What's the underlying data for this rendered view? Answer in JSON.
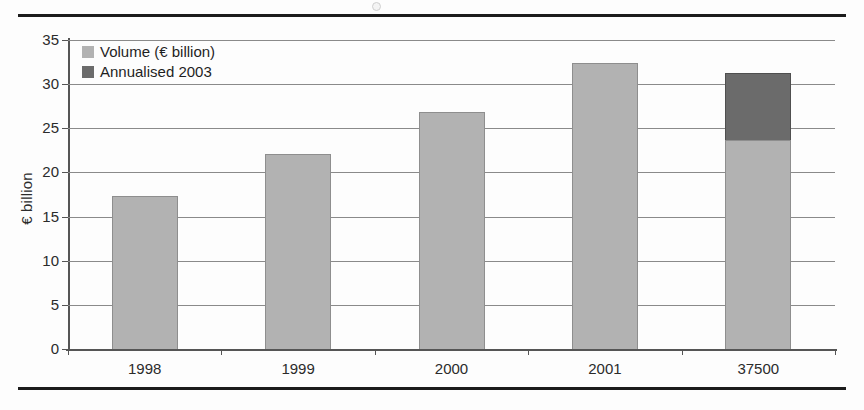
{
  "figure": {
    "background_color": "#fdfdfd",
    "rule_color": "#1c1c1c"
  },
  "legend": {
    "position": "top-left-inside",
    "items": [
      {
        "label": "Volume (€ billion)",
        "color": "#b2b2b2",
        "swatch_name": "legend-swatch-volume"
      },
      {
        "label": "Annualised 2003",
        "color": "#6b6b6b",
        "swatch_name": "legend-swatch-annualised"
      }
    ]
  },
  "chart_data": {
    "type": "bar",
    "subtype": "stacked-column",
    "title": "",
    "xlabel": "",
    "ylabel": "€ billion",
    "ylim": [
      0,
      35
    ],
    "ytick_step": 5,
    "yticks": [
      "35",
      "30",
      "25",
      "20",
      "15",
      "10",
      "5",
      "0"
    ],
    "ytick_values": [
      35,
      30,
      25,
      20,
      15,
      10,
      5,
      0
    ],
    "grid": true,
    "grid_axis": "y",
    "categories": [
      "1998",
      "1999",
      "2000",
      "2001",
      "37500"
    ],
    "series": [
      {
        "name": "Volume (€ billion)",
        "color": "#b2b2b2",
        "values": [
          17.3,
          22.1,
          26.9,
          32.4,
          23.7
        ]
      },
      {
        "name": "Annualised 2003",
        "color": "#6b6b6b",
        "values": [
          0,
          0,
          0,
          0,
          7.6
        ]
      }
    ],
    "totals": [
      17.3,
      22.1,
      26.9,
      32.4,
      31.3
    ],
    "annotations": []
  }
}
